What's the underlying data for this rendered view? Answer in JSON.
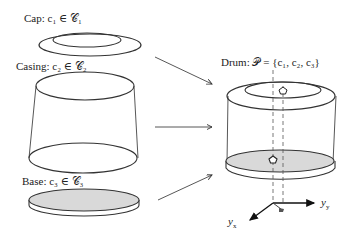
{
  "labels": {
    "cap": "Cap: c₁ ∈ 𝒞₁",
    "casing": "Casing: c₂ ∈ 𝒞₂",
    "base": "Base: c₃ ∈ 𝒞₃",
    "drum": "Drum: 𝒫 = {c₁, c₂, c₃}"
  },
  "axes": {
    "x_label": "y",
    "x_sub": "x",
    "y_label": "y",
    "y_sub": "y"
  },
  "colors": {
    "stroke": "#333333",
    "fill_base": "#d9d9d9",
    "background": "#ffffff"
  },
  "markers": {
    "top_marker": "pentagon",
    "bottom_marker": "pentagon"
  }
}
